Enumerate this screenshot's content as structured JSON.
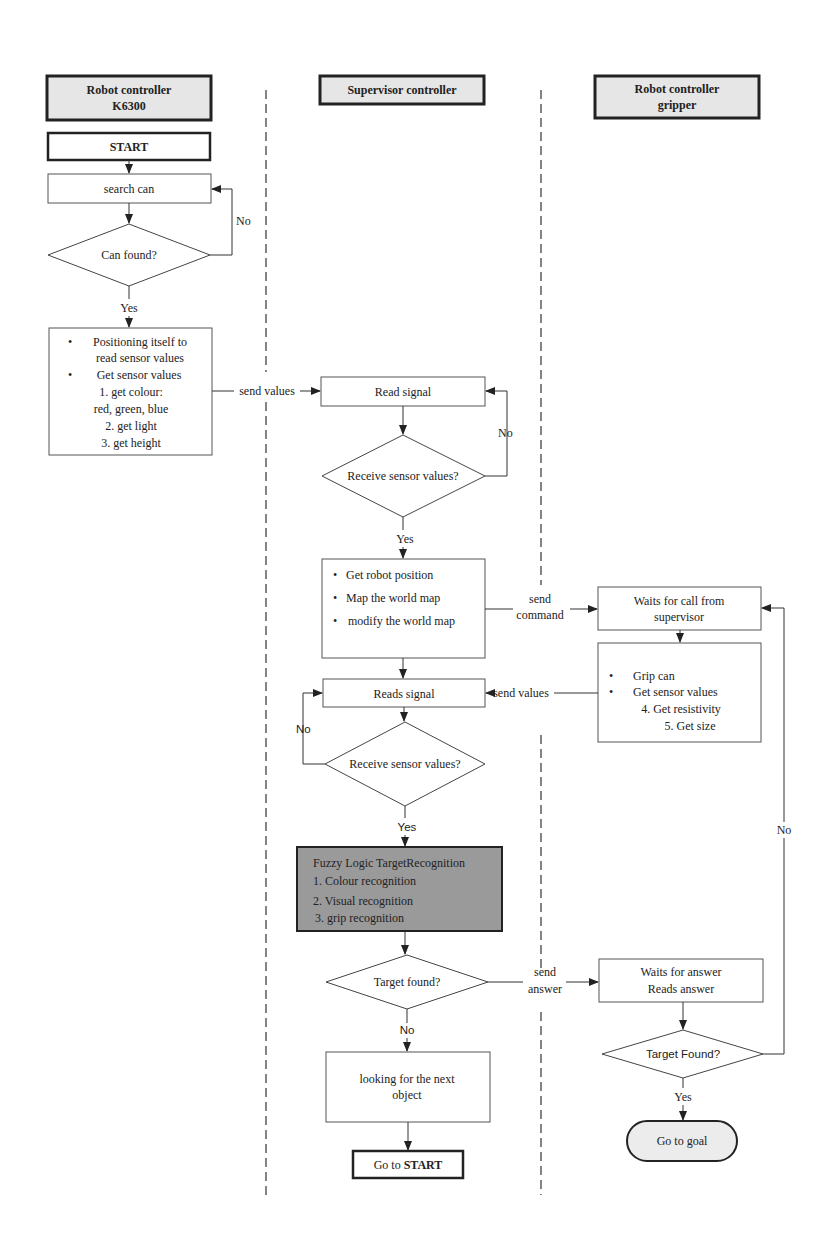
{
  "lanes": [
    {
      "header": [
        "Robot controller",
        "K6300"
      ]
    },
    {
      "header": [
        "Supervisor controller"
      ]
    },
    {
      "header": [
        "Robot controller",
        "gripper"
      ]
    }
  ],
  "robot": {
    "start": "START",
    "search": "search can",
    "decision": "Can found?",
    "no": "No",
    "yes": "Yes",
    "sensor_box": {
      "bullet1": [
        "Positioning itself to",
        "read sensor values"
      ],
      "bullet2": "Get sensor values",
      "items": [
        "1. get colour:",
        "red, green, blue",
        "2. get light",
        "3. get height"
      ]
    },
    "send_values": "send values"
  },
  "supervisor": {
    "read_signal": "Read signal",
    "decision1": "Receive sensor values?",
    "no1": "No",
    "yes1": "Yes",
    "map_box": [
      "Get robot  position",
      "Map the world map",
      "modify the world map"
    ],
    "send_command": [
      "send",
      "command"
    ],
    "reads_signal": "Reads signal",
    "decision2": "Receive sensor values?",
    "no2": "No",
    "yes2": "Yes",
    "fuzzy": {
      "title": "Fuzzy Logic TargetRecognition",
      "items": [
        "1. Colour recognition",
        "2. Visual recognition",
        "3. grip   recognition"
      ]
    },
    "decision3": "Target found?",
    "send_answer": [
      "send",
      "answer"
    ],
    "no3": "No",
    "next_object": [
      "looking for the next",
      "object"
    ],
    "goto_start_prefix": "Go to ",
    "goto_start_bold": "START"
  },
  "gripper": {
    "waits_call": [
      "Waits for call from",
      "supervisor"
    ],
    "grip_box": {
      "bullet1": "Grip can",
      "bullet2": "Get sensor values",
      "items": [
        "4. Get resistivity",
        "5. Get size"
      ]
    },
    "send_values": "send values",
    "waits_answer": [
      "Waits for answer",
      "Reads answer"
    ],
    "decision": "Target Found?",
    "yes": "Yes",
    "no": "No",
    "goal": "Go to goal"
  }
}
